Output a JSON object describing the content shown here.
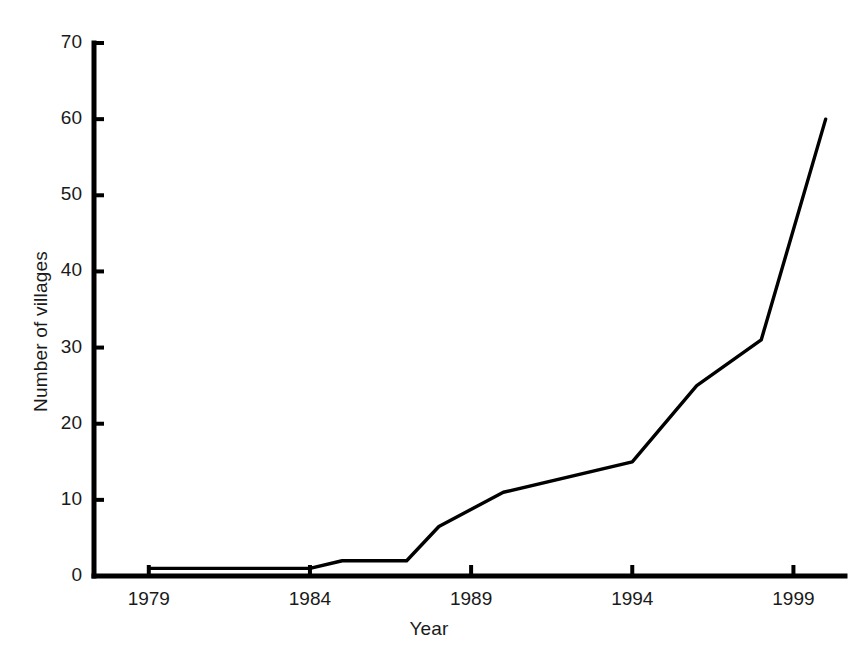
{
  "chart_data": {
    "type": "line",
    "title": "",
    "xlabel": "Year",
    "ylabel": "Number of villages",
    "xlim": [
      1977.3,
      2000.6
    ],
    "ylim": [
      0,
      70
    ],
    "grid": false,
    "legend": null,
    "x_ticks": [
      1979,
      1984,
      1989,
      1994,
      1999
    ],
    "x_tick_labels": [
      "1979",
      "1984",
      "1989",
      "1994",
      "1999"
    ],
    "y_ticks": [
      0,
      10,
      20,
      30,
      40,
      50,
      60,
      70
    ],
    "y_tick_labels": [
      "0",
      "10",
      "20",
      "30",
      "40",
      "50",
      "60",
      "70"
    ],
    "series": [
      {
        "name": "Number of villages",
        "color": "#000000",
        "x": [
          1979,
          1984,
          1985,
          1986,
          1987,
          1988,
          1990,
          1994,
          1996,
          1998,
          2000
        ],
        "values": [
          1,
          1,
          2,
          2,
          2,
          6.5,
          11,
          15,
          25,
          31,
          60
        ]
      }
    ]
  },
  "axis": {
    "y_label_text": "Number of villages",
    "x_label_text": "Year"
  }
}
